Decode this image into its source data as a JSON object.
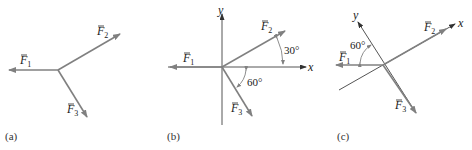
{
  "colors": {
    "vector": "#808080",
    "axis": "#555555",
    "text": "#222222"
  },
  "panels": [
    {
      "caption": "(a)",
      "vectors": [
        {
          "name": "F",
          "sub": "1"
        },
        {
          "name": "F",
          "sub": "2"
        },
        {
          "name": "F",
          "sub": "3"
        }
      ]
    },
    {
      "caption": "(b)",
      "axes": {
        "x": "x",
        "y": "y"
      },
      "vectors": [
        {
          "name": "F",
          "sub": "1"
        },
        {
          "name": "F",
          "sub": "2"
        },
        {
          "name": "F",
          "sub": "3"
        }
      ],
      "angles": [
        "30°",
        "60°"
      ]
    },
    {
      "caption": "(c)",
      "axes": {
        "x": "x",
        "y": "y"
      },
      "vectors": [
        {
          "name": "F",
          "sub": "1"
        },
        {
          "name": "F",
          "sub": "2"
        },
        {
          "name": "F",
          "sub": "3"
        }
      ],
      "angles": [
        "60°"
      ]
    }
  ]
}
